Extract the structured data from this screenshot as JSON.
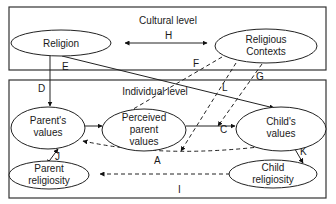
{
  "levels": {
    "cultural": "Cultural level",
    "individual": "Individual level"
  },
  "nodes": {
    "religion": {
      "lines": [
        "Religion"
      ]
    },
    "religious_contexts": {
      "lines": [
        "Religious",
        "Contexts"
      ]
    },
    "parents_values": {
      "lines": [
        "Parent's",
        "values"
      ]
    },
    "perceived_parent_values": {
      "lines": [
        "Perceived",
        "parent",
        "values"
      ]
    },
    "childs_values": {
      "lines": [
        "Child's",
        "values"
      ]
    },
    "parent_religiosity": {
      "lines": [
        "Parent",
        "religiosity"
      ]
    },
    "child_religiosity": {
      "lines": [
        "Child",
        "religiosity"
      ]
    }
  },
  "edges": [
    {
      "label": "H",
      "from": "Religion",
      "to": "Religious Contexts",
      "style": "solid",
      "direction": "bidirectional"
    },
    {
      "label": "D",
      "from": "Religion",
      "to": "Parent's values",
      "style": "solid",
      "direction": "forward"
    },
    {
      "label": "E",
      "from": "Religion",
      "to": "Child's values",
      "style": "solid",
      "direction": "forward"
    },
    {
      "label": "F",
      "from": "Religious Contexts",
      "to": "Parent's values",
      "style": "dashed",
      "direction": "forward"
    },
    {
      "label": "L",
      "from": "Religious Contexts",
      "to": "Parent's values / Child's values link (A)",
      "style": "dashed",
      "direction": "forward"
    },
    {
      "label": "G",
      "from": "Religious Contexts",
      "to": "C link",
      "style": "dashed",
      "direction": "forward"
    },
    {
      "label": "B",
      "from": "Parent's values",
      "to": "Perceived parent values",
      "style": "solid",
      "direction": "forward"
    },
    {
      "label": "C",
      "from": "Perceived parent values",
      "to": "Child's values",
      "style": "solid",
      "direction": "forward"
    },
    {
      "label": "A",
      "from": "Parent's values",
      "to": "Child's values",
      "style": "dashed",
      "direction": "bidirectional"
    },
    {
      "label": "J",
      "from": "Parent's values",
      "to": "Parent religiosity",
      "style": "solid",
      "direction": "bidirectional"
    },
    {
      "label": "K",
      "from": "Child's values",
      "to": "Child religiosity",
      "style": "solid",
      "direction": "bidirectional"
    },
    {
      "label": "I",
      "from": "Parent religiosity",
      "to": "Child religiosity",
      "style": "dashed",
      "direction": "bidirectional"
    }
  ],
  "edge_labels": {
    "H": "H",
    "D": "D",
    "E": "E",
    "F": "F",
    "L": "L",
    "G": "G",
    "B": "B",
    "C": "C",
    "A": "A",
    "J": "J",
    "K": "K",
    "I": "I"
  }
}
